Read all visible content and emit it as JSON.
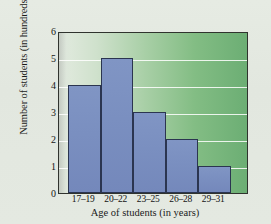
{
  "figure": {
    "background_color": "#e4e9e1"
  },
  "chart_data": {
    "type": "bar",
    "title": "",
    "subtitle": "",
    "xlabel": "Age of students (in years)",
    "ylabel": "Number of students (in hundreds)",
    "categories": [
      "17–19",
      "20–22",
      "23–25",
      "26–28",
      "29–31"
    ],
    "values": [
      4,
      5,
      3,
      2,
      1
    ],
    "ylim": [
      0,
      6
    ],
    "yticks": [
      0,
      1,
      2,
      3,
      4,
      5,
      6
    ],
    "ytick_labels": [
      "0",
      "1",
      "2",
      "3",
      "4",
      "5",
      "6"
    ],
    "grid": "horizontal",
    "gridline_color": "#ffffff",
    "legend": "none",
    "bar_fill_color": "#7a8fc0",
    "bar_edge_color": "#2b3550",
    "plot_background_gradient": [
      "#e8efe6",
      "#6cae74"
    ],
    "axis_frame_color": "#30332e",
    "series_name": "Number of students"
  }
}
